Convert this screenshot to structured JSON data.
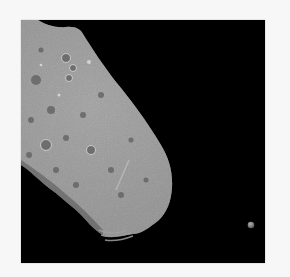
{
  "image": {
    "subject": "Asteroid with small moon against black space",
    "alt": "Grayscale spacecraft image of a cratered, elongated asteroid in the upper-left with a tiny moon to the lower right",
    "colors": {
      "background_border": "#f7f7f7",
      "space": "#000000",
      "asteroid_surface": "#9a9a9a",
      "asteroid_highlight": "#c8c8c8",
      "asteroid_shadow": "#5a5a5a",
      "moon": "#8a8a8a"
    }
  }
}
